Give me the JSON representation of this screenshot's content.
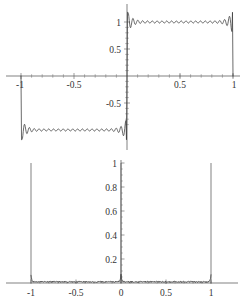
{
  "figure": {
    "title": "",
    "background": "#ffffff",
    "curve_color": "#3a3a3a",
    "axis_color": "#4a4a4a",
    "label_color": "#333333",
    "panel_count": 2
  },
  "chart_data": [
    {
      "type": "line",
      "title": "",
      "subtitle": "",
      "xlabel": "",
      "ylabel": "",
      "xlim": [
        -1.08,
        1.08
      ],
      "ylim": [
        -1.18,
        1.18
      ],
      "grid": false,
      "legend": null,
      "legend_position": "none",
      "axis_style": "centered-cross",
      "xticks": [
        -1,
        -0.5,
        0.5,
        1
      ],
      "xtick_labels": [
        "-1",
        "-0.5",
        "0.5",
        "1"
      ],
      "yticks": [
        -0.5,
        0.5,
        1
      ],
      "ytick_labels": [
        "-0.5",
        "0.5",
        "1"
      ],
      "description": "Truncated Fourier series of a square wave showing Gibbs phenomenon overshoot near the jump discontinuities at x = -1, 0, 1",
      "series": [
        {
          "name": "square-wave-partial-sum",
          "x": [
            -1.0,
            -0.98,
            -0.9,
            -0.8,
            -0.7,
            -0.6,
            -0.5,
            -0.4,
            -0.3,
            -0.2,
            -0.1,
            -0.04,
            -0.01,
            0.0,
            0.01,
            0.04,
            0.1,
            0.2,
            0.3,
            0.4,
            0.5,
            0.6,
            0.7,
            0.8,
            0.9,
            0.98,
            1.0
          ],
          "y": [
            0.0,
            -1.18,
            -1.0,
            -1.0,
            -1.0,
            -1.0,
            -1.0,
            -1.0,
            -1.0,
            -1.0,
            -1.0,
            -1.0,
            -1.18,
            0.0,
            1.18,
            1.0,
            1.0,
            1.0,
            1.0,
            1.0,
            1.0,
            1.0,
            1.0,
            1.0,
            1.0,
            1.18,
            0.0
          ]
        }
      ],
      "annotations": [
        {
          "text": "overshoot",
          "value": 1.18,
          "at_x": 0.02
        },
        {
          "text": "undershoot",
          "value": -1.18,
          "at_x": -0.02
        }
      ]
    },
    {
      "type": "line",
      "title": "",
      "subtitle": "",
      "xlabel": "",
      "ylabel": "",
      "xlim": [
        -1.08,
        1.08
      ],
      "ylim": [
        0,
        1.05
      ],
      "grid": false,
      "legend": null,
      "legend_position": "none",
      "axis_style": "bottom-x-center-y",
      "xticks": [
        -1,
        -0.5,
        0,
        0.5,
        1
      ],
      "xtick_labels": [
        "-1",
        "-0.5",
        "0",
        "0.5",
        "1"
      ],
      "yticks": [
        0.2,
        0.4,
        0.6,
        0.8,
        1
      ],
      "ytick_labels": [
        "0.2",
        "0.4",
        "0.6",
        "0.8",
        "1"
      ],
      "description": "Pointwise error magnitude of the partial sum, near zero everywhere except sharp unit spikes at the discontinuities x = -1, 0 and 1",
      "series": [
        {
          "name": "error-magnitude",
          "x": [
            -1.0,
            -0.99,
            -0.95,
            -0.8,
            -0.6,
            -0.4,
            -0.2,
            -0.05,
            -0.01,
            0.0,
            0.01,
            0.05,
            0.2,
            0.4,
            0.6,
            0.8,
            0.95,
            0.99,
            1.0
          ],
          "y": [
            1.0,
            0.02,
            0.01,
            0.01,
            0.01,
            0.01,
            0.01,
            0.02,
            0.05,
            1.0,
            0.05,
            0.02,
            0.01,
            0.01,
            0.01,
            0.01,
            0.01,
            0.02,
            1.0
          ]
        }
      ],
      "spikes": [
        {
          "x": -1.0,
          "height": 1.0
        },
        {
          "x": 0.0,
          "height": 1.0
        },
        {
          "x": 1.0,
          "height": 1.0
        }
      ]
    }
  ]
}
